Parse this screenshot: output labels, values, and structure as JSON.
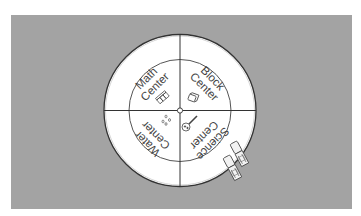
{
  "diagram": {
    "type": "learning-center-rotation-wheel",
    "colors": {
      "background": "#a3a3a3",
      "page": "#ffffff",
      "wheel_fill": "#ffffff",
      "stroke": "#333333",
      "text": "#444444"
    },
    "centers": [
      {
        "line1": "Math",
        "line2": "Center",
        "icon": "math-manipulatives-icon"
      },
      {
        "line1": "Block",
        "line2": "Center",
        "icon": "block-icon"
      },
      {
        "line1": "Science",
        "line2": "Center",
        "icon": "magnifying-glass-icon"
      },
      {
        "line1": "Water",
        "line2": "Center",
        "icon": "water-drops-icon"
      }
    ],
    "clips": [
      {
        "name": "clothespin-1"
      },
      {
        "name": "clothespin-2"
      }
    ]
  }
}
